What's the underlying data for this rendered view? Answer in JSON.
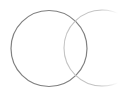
{
  "diagram": {
    "type": "venn-two-circles",
    "background": "#ffffff",
    "circles": [
      {
        "name": "left-circle",
        "cx": 49,
        "cy": 48.5,
        "r": 38,
        "stroke": "#808080",
        "stroke_width": 1.2
      },
      {
        "name": "right-circle",
        "cx": 102,
        "cy": 48,
        "r": 38,
        "stroke": "#c4c4c4",
        "stroke_width": 1.1
      }
    ],
    "clip_right_x": 118
  }
}
